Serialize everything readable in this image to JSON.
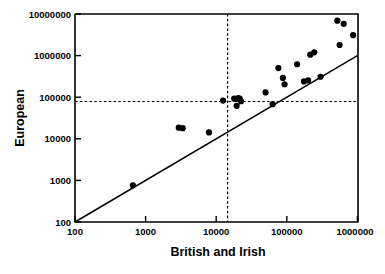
{
  "chart_data": {
    "type": "scatter",
    "title": "",
    "xlabel": "British and Irish",
    "ylabel": "European",
    "xscale": "log",
    "yscale": "log",
    "xlim": [
      100,
      1000000
    ],
    "ylim": [
      100,
      10000000
    ],
    "grid": false,
    "legend": null,
    "xticks": [
      100,
      1000,
      10000,
      100000,
      1000000
    ],
    "xticklabels": [
      "100",
      "1000",
      "10000",
      "100000",
      "1000000"
    ],
    "yticks": [
      100,
      1000,
      10000,
      100000,
      1000000,
      10000000
    ],
    "yticklabels": [
      "100",
      "1000",
      "10000",
      "100000",
      "1000000",
      "10000000"
    ],
    "points": [
      {
        "x": 660,
        "y": 760
      },
      {
        "x": 2950,
        "y": 18500
      },
      {
        "x": 3350,
        "y": 18000
      },
      {
        "x": 7900,
        "y": 14200
      },
      {
        "x": 12500,
        "y": 83000
      },
      {
        "x": 18000,
        "y": 93000
      },
      {
        "x": 19000,
        "y": 90000
      },
      {
        "x": 19500,
        "y": 62000
      },
      {
        "x": 20500,
        "y": 95000
      },
      {
        "x": 21500,
        "y": 93000
      },
      {
        "x": 22500,
        "y": 80000
      },
      {
        "x": 50000,
        "y": 130000
      },
      {
        "x": 63000,
        "y": 68000
      },
      {
        "x": 76000,
        "y": 500000
      },
      {
        "x": 88000,
        "y": 290000
      },
      {
        "x": 93000,
        "y": 205000
      },
      {
        "x": 140000,
        "y": 620000
      },
      {
        "x": 175000,
        "y": 240000
      },
      {
        "x": 200000,
        "y": 255000
      },
      {
        "x": 215000,
        "y": 1050000
      },
      {
        "x": 245000,
        "y": 1200000
      },
      {
        "x": 300000,
        "y": 310000
      },
      {
        "x": 520000,
        "y": 6900000
      },
      {
        "x": 560000,
        "y": 1800000
      },
      {
        "x": 640000,
        "y": 5800000
      },
      {
        "x": 870000,
        "y": 3100000
      }
    ],
    "reference_line": {
      "name": "identity-line",
      "from": [
        100,
        100
      ],
      "to": [
        1000000,
        1000000
      ]
    },
    "guide_lines": [
      {
        "name": "horizontal-threshold",
        "orientation": "horizontal",
        "value": 70000
      },
      {
        "name": "vertical-threshold",
        "orientation": "vertical",
        "value": 18000
      }
    ]
  }
}
